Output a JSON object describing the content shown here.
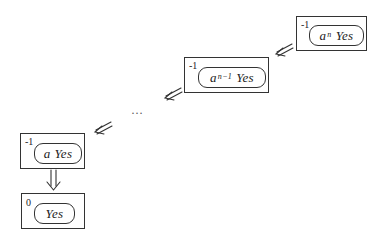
{
  "diagram": {
    "nodes": [
      {
        "id": "node-an",
        "superscript": "-1",
        "base": "a",
        "exponent": "n",
        "word": "Yes"
      },
      {
        "id": "node-an-1",
        "superscript": "-1",
        "base": "a",
        "exponent": "n−1",
        "word": "Yes"
      },
      {
        "id": "node-a",
        "superscript": "-1",
        "base": "a",
        "exponent": "",
        "word": "Yes"
      },
      {
        "id": "node-yes",
        "superscript": "0",
        "base": "",
        "exponent": "",
        "word": "Yes"
      }
    ],
    "ellipsis": "…",
    "edges": [
      {
        "from": "node-an",
        "to": "node-an-1",
        "style": "double-arrow"
      },
      {
        "from": "node-an-1",
        "to": "ellipsis",
        "style": "double-arrow"
      },
      {
        "from": "ellipsis",
        "to": "node-a",
        "style": "double-arrow"
      },
      {
        "from": "node-a",
        "to": "node-yes",
        "style": "double-arrow"
      }
    ],
    "colors": {
      "stroke": "#333333",
      "background": "#ffffff"
    }
  }
}
